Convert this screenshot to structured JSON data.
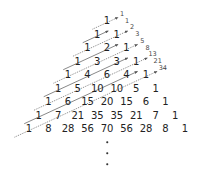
{
  "rows": [
    [
      "1"
    ],
    [
      "1",
      "1"
    ],
    [
      "1",
      "2",
      "1"
    ],
    [
      "1",
      "3",
      "3",
      "1"
    ],
    [
      "1",
      "4",
      "6",
      "4",
      "1"
    ],
    [
      "1",
      "5",
      "10",
      "10",
      "5",
      "1"
    ],
    [
      "1",
      "6",
      "15",
      "20",
      "15",
      "6",
      "1"
    ],
    [
      "1",
      "7",
      "21",
      "35",
      "35",
      "21",
      "7",
      "1"
    ],
    [
      "1",
      "8",
      "28",
      "56",
      "70",
      "56",
      "28",
      "8",
      "1"
    ]
  ],
  "fibonacci_labels": [
    "1",
    "1",
    "2",
    "3",
    "5",
    "8",
    "13",
    "21",
    "34"
  ],
  "continuation": "⋮",
  "colors": {
    "text": "#222222",
    "label": "#444444",
    "line": "#555555",
    "background": "#ffffff"
  }
}
